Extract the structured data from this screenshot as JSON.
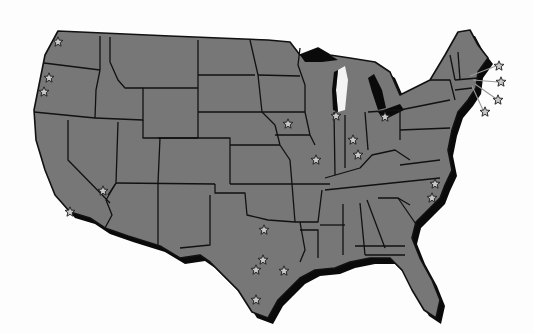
{
  "map": {
    "title": "",
    "region": "Contiguous United States",
    "colors": {
      "background": "#fdfdfd",
      "land": "#777777",
      "border": "#111111",
      "shadow": "#0a0a0a",
      "star_fill": "#c8c8c8"
    },
    "markers": [
      {
        "id": "wa-seattle",
        "region": "Washington",
        "x": 58,
        "y": 42
      },
      {
        "id": "or-portland",
        "region": "Oregon",
        "x": 49,
        "y": 78
      },
      {
        "id": "or-salem",
        "region": "Oregon",
        "x": 44,
        "y": 92
      },
      {
        "id": "ca-las-vegas-area",
        "region": "California/Nevada",
        "x": 103,
        "y": 191
      },
      {
        "id": "ca-los-angeles",
        "region": "California",
        "x": 70,
        "y": 212
      },
      {
        "id": "ia-des-moines",
        "region": "Iowa",
        "x": 288,
        "y": 124
      },
      {
        "id": "il-chicago",
        "region": "Illinois",
        "x": 336,
        "y": 116
      },
      {
        "id": "oh-toledo",
        "region": "Ohio",
        "x": 385,
        "y": 117
      },
      {
        "id": "in-indianapolis",
        "region": "Indiana",
        "x": 353,
        "y": 140
      },
      {
        "id": "in-south",
        "region": "Indiana",
        "x": 358,
        "y": 155
      },
      {
        "id": "mo-st-louis",
        "region": "Missouri",
        "x": 316,
        "y": 160
      },
      {
        "id": "nc-raleigh",
        "region": "North Carolina",
        "x": 435,
        "y": 184
      },
      {
        "id": "nc-wilmington",
        "region": "North Carolina",
        "x": 432,
        "y": 198
      },
      {
        "id": "tx-dallas",
        "region": "Texas",
        "x": 264,
        "y": 230
      },
      {
        "id": "tx-austin",
        "region": "Texas",
        "x": 263,
        "y": 260
      },
      {
        "id": "tx-san-antonio",
        "region": "Texas",
        "x": 256,
        "y": 270
      },
      {
        "id": "tx-houston",
        "region": "Texas",
        "x": 284,
        "y": 271
      },
      {
        "id": "tx-corpus",
        "region": "Texas",
        "x": 256,
        "y": 300
      },
      {
        "id": "la-lake-charles",
        "region": "Louisiana",
        "x": 284,
        "y": 271
      },
      {
        "id": "ne-callout-1",
        "region": "Massachusetts",
        "x": 499,
        "y": 66,
        "leader_to": [
          470,
          76
        ]
      },
      {
        "id": "ne-callout-2",
        "region": "Massachusetts",
        "x": 501,
        "y": 82,
        "leader_to": [
          473,
          80
        ]
      },
      {
        "id": "ne-callout-3",
        "region": "Rhode Island",
        "x": 498,
        "y": 100,
        "leader_to": [
          475,
          85
        ]
      },
      {
        "id": "ne-callout-4",
        "region": "Connecticut",
        "x": 485,
        "y": 112,
        "leader_to": [
          472,
          86
        ]
      }
    ]
  }
}
